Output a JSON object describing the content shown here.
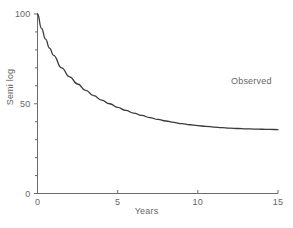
{
  "chart_data": {
    "type": "line",
    "title": "",
    "subtitle": "",
    "xlabel": "Years",
    "ylabel": "Semi log",
    "xlim": [
      0,
      15
    ],
    "ylim": [
      0,
      100
    ],
    "grid": false,
    "legend_position": "inline-right",
    "x_ticks": [
      {
        "value": 0,
        "label": "0"
      },
      {
        "value": 5,
        "label": "5"
      },
      {
        "value": 10,
        "label": "10"
      },
      {
        "value": 15,
        "label": "15"
      }
    ],
    "y_ticks": [
      {
        "value": 0,
        "label": "0"
      },
      {
        "value": 50,
        "label": "50"
      },
      {
        "value": 100,
        "label": "100"
      }
    ],
    "y_minor_ticks": [
      10,
      20,
      30,
      40,
      60,
      70,
      80,
      90
    ],
    "series": [
      {
        "name": "Observed",
        "annotation": "Observed",
        "color": "#3a3a3a",
        "x": [
          0,
          0.25,
          0.5,
          0.75,
          1,
          1.5,
          2,
          2.5,
          3,
          3.5,
          4,
          4.5,
          5,
          5.5,
          6,
          6.5,
          7,
          7.5,
          8,
          8.5,
          9,
          9.5,
          10,
          10.5,
          11,
          11.5,
          12,
          12.5,
          13,
          13.5,
          14,
          14.5,
          15
        ],
        "values": [
          100,
          92,
          86,
          81,
          77,
          70,
          65,
          61,
          57.5,
          54.5,
          52,
          50,
          48,
          46.3,
          44.8,
          43.5,
          42.3,
          41.3,
          40.4,
          39.6,
          38.9,
          38.3,
          37.8,
          37.4,
          37,
          36.7,
          36.4,
          36.2,
          36,
          35.9,
          35.8,
          35.7,
          35.6
        ]
      }
    ]
  },
  "annotations": {
    "observed_label": "Observed"
  },
  "axis_titles": {
    "x": "Years",
    "y": "Semi log"
  },
  "colors": {
    "curve": "#3a3a3a",
    "axis": "#6b6b6b",
    "text": "#666666",
    "background": "#ffffff"
  }
}
